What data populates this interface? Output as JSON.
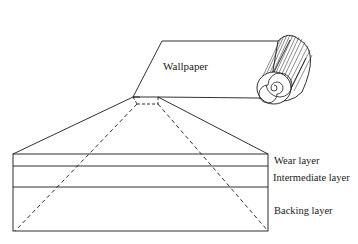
{
  "diagram": {
    "type": "exploded cross-section",
    "labels": {
      "wallpaper": "Wallpaper",
      "wear_layer": "Wear layer",
      "intermediate_layer": "Intermediate layer",
      "backing_layer": "Backing layer"
    },
    "colors": {
      "stroke": "#1a1a1a",
      "background": "#ffffff"
    }
  }
}
